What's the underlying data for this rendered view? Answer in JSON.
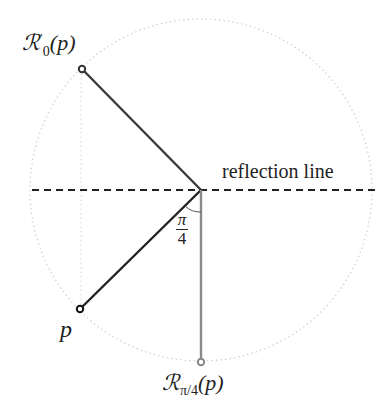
{
  "labels": {
    "top_point": {
      "script": "ℛ",
      "prime": "′",
      "sub": "0",
      "arg": "(p)"
    },
    "bottom_point": {
      "script": "ℛ",
      "sub": "π/4",
      "arg": "(p)"
    },
    "p": "p",
    "reflection_line": "reflection line",
    "angle": {
      "num": "π",
      "den": "4"
    }
  },
  "geometry": {
    "center": [
      201,
      190
    ],
    "radius": 171,
    "p": [
      80,
      309
    ],
    "reflected_top": [
      82,
      69
    ],
    "rotated_bottom": [
      201,
      362
    ]
  },
  "colors": {
    "dark_line": "#333333",
    "gray_line": "#8a8a8a",
    "dotted": "#cfcfcf"
  }
}
